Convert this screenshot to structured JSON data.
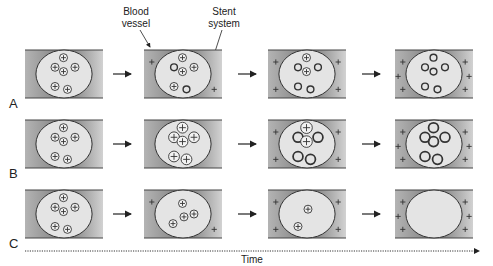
{
  "annotations": {
    "blood_vessel": "Blood\nvessel",
    "blood_vessel_lines": [
      "Blood",
      "vessel"
    ],
    "stent_system_lines": [
      "Stent",
      "system"
    ]
  },
  "rows": [
    {
      "label": "A",
      "stages": [
        {
          "particles": [
            "plus",
            "plus",
            "plus",
            "plus",
            "plus",
            "plus"
          ],
          "tissue_plus_count": 0
        },
        {
          "particles": [
            "plus",
            "empty",
            "plus",
            "plus",
            "plus",
            "empty"
          ],
          "tissue_plus_count": 2
        },
        {
          "particles": [
            "plus",
            "empty",
            "plus",
            "empty",
            "empty",
            "empty"
          ],
          "tissue_plus_count": 4
        },
        {
          "particles": [
            "empty",
            "empty",
            "empty",
            "empty",
            "empty",
            "empty"
          ],
          "tissue_plus_count": 6
        }
      ]
    },
    {
      "label": "B",
      "stages": [
        {
          "particles": [
            "plus",
            "plus",
            "plus",
            "plus",
            "plus",
            "plus"
          ],
          "tissue_plus_count": 0,
          "swell": 1.0
        },
        {
          "particles": [
            "plus",
            "plus",
            "plus",
            "plus",
            "plus",
            "plus"
          ],
          "tissue_plus_count": 0,
          "swell": 1.35
        },
        {
          "particles": [
            "plus",
            "empty",
            "plus",
            "empty",
            "empty",
            "empty"
          ],
          "tissue_plus_count": 4,
          "swell": 1.45
        },
        {
          "particles": [
            "empty",
            "empty",
            "empty",
            "empty",
            "empty",
            "empty"
          ],
          "tissue_plus_count": 6,
          "swell": 1.45
        }
      ]
    },
    {
      "label": "C",
      "stages": [
        {
          "particles": [
            "plus",
            "plus",
            "plus",
            "plus",
            "plus",
            "plus"
          ],
          "tissue_plus_count": 0
        },
        {
          "particles": [
            "plus",
            "plus",
            "plus",
            "plus"
          ],
          "tissue_plus_count": 2
        },
        {
          "particles": [
            "plus",
            "plus"
          ],
          "tissue_plus_count": 4
        },
        {
          "particles": [],
          "tissue_plus_count": 6
        }
      ]
    }
  ],
  "time_axis": {
    "label": "Time"
  },
  "colors": {
    "vessel_dark": "#8c8c8c",
    "vessel_light": "#d6d6d6",
    "stent_fill": "#e4e4e4",
    "outline": "#333333",
    "particle_fill": "#f2f2f2"
  }
}
